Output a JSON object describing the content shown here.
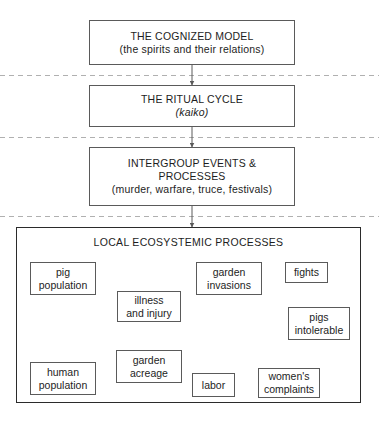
{
  "diagram": {
    "tiers": [
      {
        "id": "cognized-model",
        "line1": "THE COGNIZED MODEL",
        "line2": "(the spirits and their relations)",
        "line3": ""
      },
      {
        "id": "ritual-cycle",
        "line1": "THE RITUAL CYCLE",
        "line2": "(kaiko)",
        "line3": ""
      },
      {
        "id": "intergroup-events",
        "line1": "INTERGROUP EVENTS &",
        "line2": "PROCESSES",
        "line3": "(murder, warfare, truce, festivals)"
      }
    ],
    "container": {
      "id": "local-ecosystemic-processes",
      "title": "LOCAL ECOSYSTEMIC PROCESSES"
    },
    "nodes": [
      {
        "id": "pig-population",
        "line1": "pig",
        "line2": "population"
      },
      {
        "id": "illness-and-injury",
        "line1": "illness",
        "line2": "and injury"
      },
      {
        "id": "garden-invasions",
        "line1": "garden",
        "line2": "invasions"
      },
      {
        "id": "fights",
        "line1": "fights",
        "line2": ""
      },
      {
        "id": "pigs-intolerable",
        "line1": "pigs",
        "line2": "intolerable"
      },
      {
        "id": "human-population",
        "line1": "human",
        "line2": "population"
      },
      {
        "id": "garden-acreage",
        "line1": "garden",
        "line2": "acreage"
      },
      {
        "id": "labor",
        "line1": "labor",
        "line2": ""
      },
      {
        "id": "womens-complaints",
        "line1": "women's",
        "line2": "complaints"
      }
    ],
    "connections": [
      {
        "from": "cognized-model",
        "to": "ritual-cycle"
      },
      {
        "from": "ritual-cycle",
        "to": "intergroup-events"
      },
      {
        "from": "intergroup-events",
        "to": "local-ecosystemic-processes"
      },
      {
        "from": "pig-population",
        "to": "garden-invasions"
      },
      {
        "from": "pig-population",
        "to": "human-population"
      },
      {
        "from": "pig-population",
        "to": "garden-acreage"
      },
      {
        "from": "illness-and-injury",
        "to": "pig-population"
      },
      {
        "from": "illness-and-injury",
        "to": "garden-acreage"
      },
      {
        "from": "garden-invasions",
        "to": "fights"
      },
      {
        "from": "fights",
        "to": "pigs-intolerable"
      },
      {
        "from": "garden-acreage",
        "to": "garden-invasions"
      },
      {
        "from": "garden-acreage",
        "to": "labor"
      },
      {
        "from": "human-population",
        "to": "garden-acreage"
      },
      {
        "from": "labor",
        "to": "womens-complaints"
      },
      {
        "from": "womens-complaints",
        "to": "pigs-intolerable"
      }
    ],
    "colors": {
      "stroke": "#5a5a5a",
      "container_stroke": "#2b2b2b",
      "divider": "#b0b0b0",
      "text": "#1d1d1d",
      "background": "#ffffff"
    }
  }
}
